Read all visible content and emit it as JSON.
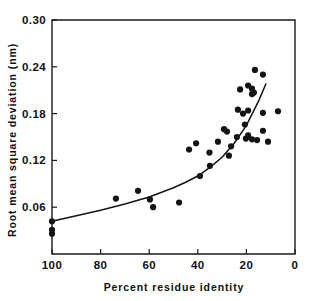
{
  "chart_data": {
    "type": "scatter",
    "title": "",
    "xlabel": "Percent residue identity",
    "ylabel": "Root mean square deviation (nm)",
    "xlim": [
      100,
      0
    ],
    "ylim": [
      0,
      0.3
    ],
    "x_ticks": [
      100,
      80,
      60,
      40,
      20,
      0
    ],
    "x_ticklabels": [
      "100",
      "80",
      "60",
      "40",
      "20",
      "0"
    ],
    "y_ticks": [
      0.06,
      0.12,
      0.18,
      0.24,
      0.3
    ],
    "y_ticklabels": [
      "0.06",
      "0.12",
      "0.18",
      "0.24",
      "0.30"
    ],
    "grid": false,
    "legend": null,
    "x_axis_inverted": true,
    "marker": "filled-circle",
    "marker_color": "#141414",
    "points": [
      {
        "x": 100.0,
        "y": 0.042
      },
      {
        "x": 100.0,
        "y": 0.031
      },
      {
        "x": 100.0,
        "y": 0.026
      },
      {
        "x": 73.7,
        "y": 0.071
      },
      {
        "x": 64.6,
        "y": 0.081
      },
      {
        "x": 59.7,
        "y": 0.07
      },
      {
        "x": 58.4,
        "y": 0.06
      },
      {
        "x": 47.7,
        "y": 0.066
      },
      {
        "x": 43.6,
        "y": 0.134
      },
      {
        "x": 40.7,
        "y": 0.142
      },
      {
        "x": 39.1,
        "y": 0.1
      },
      {
        "x": 35.2,
        "y": 0.13
      },
      {
        "x": 35.0,
        "y": 0.113
      },
      {
        "x": 31.7,
        "y": 0.144
      },
      {
        "x": 29.2,
        "y": 0.16
      },
      {
        "x": 28.0,
        "y": 0.157
      },
      {
        "x": 27.2,
        "y": 0.126
      },
      {
        "x": 26.3,
        "y": 0.138
      },
      {
        "x": 23.9,
        "y": 0.15
      },
      {
        "x": 23.5,
        "y": 0.185
      },
      {
        "x": 22.6,
        "y": 0.211
      },
      {
        "x": 21.4,
        "y": 0.18
      },
      {
        "x": 20.6,
        "y": 0.166
      },
      {
        "x": 20.2,
        "y": 0.148
      },
      {
        "x": 19.3,
        "y": 0.152
      },
      {
        "x": 19.3,
        "y": 0.184
      },
      {
        "x": 19.3,
        "y": 0.216
      },
      {
        "x": 17.7,
        "y": 0.205
      },
      {
        "x": 17.7,
        "y": 0.212
      },
      {
        "x": 17.7,
        "y": 0.147
      },
      {
        "x": 16.9,
        "y": 0.207
      },
      {
        "x": 16.5,
        "y": 0.236
      },
      {
        "x": 15.6,
        "y": 0.146
      },
      {
        "x": 13.2,
        "y": 0.23
      },
      {
        "x": 13.2,
        "y": 0.181
      },
      {
        "x": 13.2,
        "y": 0.158
      },
      {
        "x": 11.1,
        "y": 0.144
      },
      {
        "x": 7.0,
        "y": 0.183
      }
    ],
    "fit_curve": {
      "label": "fitted trend",
      "x": [
        100,
        90,
        80,
        70,
        60,
        50,
        45,
        40,
        35,
        30,
        25,
        20,
        15,
        12
      ],
      "y": [
        0.042,
        0.049,
        0.056,
        0.064,
        0.073,
        0.085,
        0.092,
        0.1,
        0.111,
        0.124,
        0.142,
        0.165,
        0.196,
        0.218
      ]
    }
  }
}
